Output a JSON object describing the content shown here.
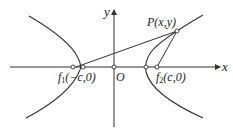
{
  "diagram": {
    "type": "hyperbola-foci",
    "axes": {
      "x_label": "x",
      "y_label": "y",
      "origin_label": "O"
    },
    "points": {
      "focus_left": {
        "label_main": "f",
        "label_sub": "1",
        "label_coords": "(−c,0)"
      },
      "focus_right": {
        "label_main": "f",
        "label_sub": "2",
        "label_coords": "(c,0)"
      },
      "P": {
        "label": "P(x,y)"
      }
    },
    "colors": {
      "stroke": "#333333",
      "text": "#222222",
      "background": "#ffffff"
    }
  }
}
